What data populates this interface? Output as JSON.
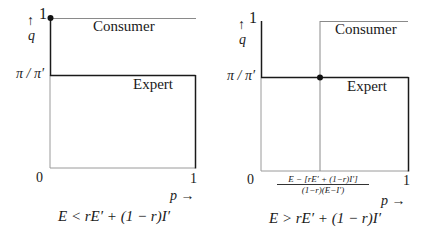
{
  "panels": [
    {
      "id": "left",
      "y_axis_label": "q",
      "y_arrow": "↑",
      "y_tick_top": "1",
      "y_tick_mid": "π / π′",
      "x_tick_left": "0",
      "x_tick_right": "1",
      "x_axis_label": "p →",
      "region_top": "Consumer",
      "region_bottom": "Expert",
      "condition": "E < rE′ + (1 − r)I′"
    },
    {
      "id": "right",
      "y_axis_label": "q",
      "y_arrow": "↑",
      "y_tick_top": "1",
      "y_tick_mid": "π / π′",
      "x_tick_left": "0",
      "x_tick_right": "1",
      "x_threshold_numerator": "E − [rE′ + (1−r)I′]",
      "x_threshold_denominator": "(1−r)(E−I′)",
      "x_axis_label": "p →",
      "region_top": "Consumer",
      "region_bottom": "Expert",
      "condition": "E > rE′ + (1 − r)I′"
    }
  ],
  "colors": {
    "dark_line": "#1a1a1a",
    "grey_line": "#9a9a9a",
    "dot": "#111111"
  }
}
